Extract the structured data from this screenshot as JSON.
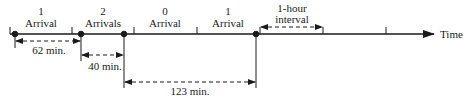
{
  "diagram": {
    "axis_label": "Time",
    "segments": [
      {
        "count": "1",
        "label": "Arrival"
      },
      {
        "count": "2",
        "label": "Arrivals"
      },
      {
        "count": "0",
        "label": "Arrival"
      },
      {
        "count": "1",
        "label": "Arrival"
      }
    ],
    "interval": {
      "line1": "1-hour",
      "line2": "interval"
    },
    "gaps": [
      {
        "label": "62 min."
      },
      {
        "label": "40 min."
      },
      {
        "label": "123 min."
      }
    ]
  }
}
